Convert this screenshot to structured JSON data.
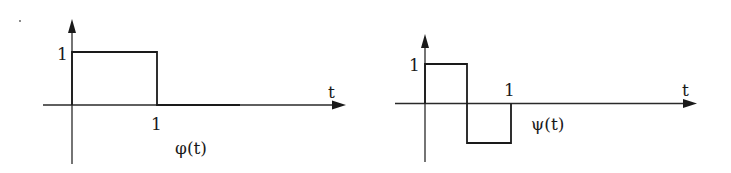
{
  "diagram": {
    "panels": [
      {
        "name": "scaling-function",
        "function_label": "φ(t)",
        "x_axis_label": "t",
        "y_tick_label": "1",
        "x_tick_label": "1",
        "segments": [
          {
            "t_start": 0,
            "t_end": 1,
            "value": 1
          }
        ]
      },
      {
        "name": "wavelet",
        "function_label": "ψ(t)",
        "x_axis_label": "t",
        "y_tick_label": "1",
        "x_tick_label": "1",
        "segments": [
          {
            "t_start": 0,
            "t_end": 0.5,
            "value": 1
          },
          {
            "t_start": 0.5,
            "t_end": 1,
            "value": -1
          }
        ]
      }
    ]
  }
}
